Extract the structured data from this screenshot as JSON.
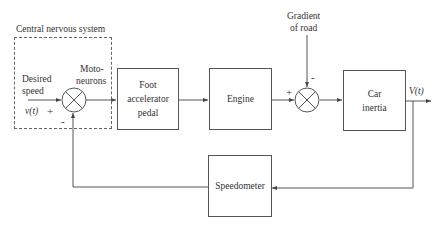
{
  "diagram": {
    "type": "block-diagram",
    "groups": {
      "cns": {
        "label": "Central nervous system"
      }
    },
    "inputs": {
      "desired_speed_label": "Desired\nspeed",
      "desired_speed_line1": "Desired",
      "desired_speed_line2": "speed",
      "signal": "v(t)",
      "disturbance_line1": "Gradient",
      "disturbance_line2": "of road"
    },
    "junctions": {
      "motoneurons_line1": "Moto-",
      "motoneurons_line2": "neurons",
      "sum1_plus": "+",
      "sum1_minus": "-",
      "sum2_plus": "+",
      "sum2_minus": "-"
    },
    "blocks": {
      "foot_line1": "Foot",
      "foot_line2": "accelerator",
      "foot_line3": "pedal",
      "engine": "Engine",
      "car_line1": "Car",
      "car_line2": "inertia",
      "speedometer": "Speedometer"
    },
    "outputs": {
      "signal": "V(t)"
    },
    "edges": [
      {
        "from": "desired-speed",
        "to": "sum1",
        "sign": "+"
      },
      {
        "from": "sum1",
        "to": "foot-accelerator-pedal"
      },
      {
        "from": "foot-accelerator-pedal",
        "to": "engine"
      },
      {
        "from": "engine",
        "to": "sum2",
        "sign": "+"
      },
      {
        "from": "gradient-of-road",
        "to": "sum2",
        "sign": "-"
      },
      {
        "from": "sum2",
        "to": "car-inertia"
      },
      {
        "from": "car-inertia",
        "to": "output-V(t)"
      },
      {
        "from": "output-V(t)",
        "to": "speedometer"
      },
      {
        "from": "speedometer",
        "to": "sum1",
        "sign": "-"
      }
    ]
  }
}
